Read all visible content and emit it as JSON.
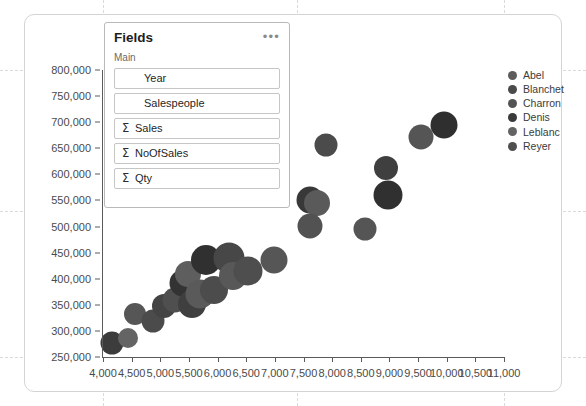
{
  "card": {
    "name": "scatter-chart-card"
  },
  "fields_panel": {
    "title": "Fields",
    "more_icon": "•••",
    "subtitle": "Main",
    "sigma_glyph": "Σ",
    "items": [
      {
        "label": "Year",
        "aggregated": false
      },
      {
        "label": "Salespeople",
        "aggregated": false
      },
      {
        "label": "Sales",
        "aggregated": true
      },
      {
        "label": "NoOfSales",
        "aggregated": true
      },
      {
        "label": "Qty",
        "aggregated": true
      }
    ]
  },
  "legend": {
    "position": "right",
    "entries": [
      {
        "label": "Abel",
        "color": "#5c5c5c"
      },
      {
        "label": "Blanchet",
        "color": "#4a4a4a"
      },
      {
        "label": "Charron",
        "color": "#545454"
      },
      {
        "label": "Denis",
        "color": "#3a3a3a"
      },
      {
        "label": "Leblanc",
        "color": "#636363"
      },
      {
        "label": "Reyer",
        "color": "#4f4f4f"
      }
    ]
  },
  "chart_data": {
    "type": "scatter",
    "title": "",
    "xlabel": "",
    "ylabel": "",
    "xlim": [
      4000,
      11000
    ],
    "ylim": [
      250000,
      800000
    ],
    "xticks": [
      4000,
      4500,
      5000,
      5500,
      6000,
      6500,
      7000,
      7500,
      8000,
      8500,
      9000,
      9500,
      10000,
      10500,
      11000
    ],
    "xticklabels": [
      "4,000",
      "4,500",
      "5,000",
      "5,500",
      "6,000",
      "6,500",
      "7,000",
      "7,500",
      "8,000",
      "8,500",
      "9,000",
      "9,500",
      "10,000",
      "10,500",
      "11,000"
    ],
    "yticks": [
      250000,
      300000,
      350000,
      400000,
      450000,
      500000,
      550000,
      600000,
      650000,
      700000,
      750000,
      800000
    ],
    "yticklabels": [
      "250,000",
      "300,000",
      "350,000",
      "400,000",
      "450,000",
      "500,000",
      "550,000",
      "600,000",
      "650,000",
      "700,000",
      "750,000",
      "800,000"
    ],
    "grid": "dashed",
    "legend_position": "right",
    "size_encodes": "Qty",
    "points": [
      {
        "series": "Denis",
        "x": 4150,
        "y": 277000,
        "r": 11.5,
        "color": "#3c3c3c"
      },
      {
        "series": "Leblanc",
        "x": 4430,
        "y": 286000,
        "r": 10.0,
        "color": "#646464"
      },
      {
        "series": "Charron",
        "x": 4560,
        "y": 333000,
        "r": 11.0,
        "color": "#565656"
      },
      {
        "series": "Abel",
        "x": 4870,
        "y": 319000,
        "r": 11.5,
        "color": "#4b4b4b"
      },
      {
        "series": "Blanchet",
        "x": 5060,
        "y": 347000,
        "r": 12.0,
        "color": "#444444"
      },
      {
        "series": "Reyer",
        "x": 5260,
        "y": 360000,
        "r": 12.5,
        "color": "#4f4f4f"
      },
      {
        "series": "Denis",
        "x": 5390,
        "y": 391000,
        "r": 13.5,
        "color": "#333333"
      },
      {
        "series": "Leblanc",
        "x": 5480,
        "y": 409000,
        "r": 13.0,
        "color": "#5e5e5e"
      },
      {
        "series": "Charron",
        "x": 5560,
        "y": 352000,
        "r": 14.0,
        "color": "#3f3f3f"
      },
      {
        "series": "Abel",
        "x": 5700,
        "y": 371000,
        "r": 14.5,
        "color": "#5a5a5a"
      },
      {
        "series": "Blanchet",
        "x": 5790,
        "y": 436000,
        "r": 15.0,
        "color": "#303030"
      },
      {
        "series": "Reyer",
        "x": 5930,
        "y": 378000,
        "r": 14.0,
        "color": "#4c4c4c"
      },
      {
        "series": "Denis",
        "x": 6200,
        "y": 440000,
        "r": 15.5,
        "color": "#474747"
      },
      {
        "series": "Leblanc",
        "x": 6270,
        "y": 405000,
        "r": 14.0,
        "color": "#585858"
      },
      {
        "series": "Charron",
        "x": 6530,
        "y": 415000,
        "r": 14.5,
        "color": "#4e4e4e"
      },
      {
        "series": "Abel",
        "x": 6980,
        "y": 436000,
        "r": 13.5,
        "color": "#565656"
      },
      {
        "series": "Blanchet",
        "x": 7620,
        "y": 551000,
        "r": 13.5,
        "color": "#383838"
      },
      {
        "series": "Reyer",
        "x": 7740,
        "y": 545000,
        "r": 13.0,
        "color": "#5a5a5a"
      },
      {
        "series": "Denis",
        "x": 7620,
        "y": 501000,
        "r": 12.5,
        "color": "#525252"
      },
      {
        "series": "Charron",
        "x": 7900,
        "y": 657000,
        "r": 11.5,
        "color": "#4b4b4b"
      },
      {
        "series": "Leblanc",
        "x": 8570,
        "y": 496000,
        "r": 11.5,
        "color": "#555555"
      },
      {
        "series": "Abel",
        "x": 8940,
        "y": 613000,
        "r": 12.0,
        "color": "#3f3f3f"
      },
      {
        "series": "Blanchet",
        "x": 8970,
        "y": 561000,
        "r": 14.5,
        "color": "#303030"
      },
      {
        "series": "Reyer",
        "x": 9550,
        "y": 672000,
        "r": 12.5,
        "color": "#555555"
      },
      {
        "series": "Denis",
        "x": 9950,
        "y": 694000,
        "r": 13.5,
        "color": "#2f2f2f"
      }
    ]
  },
  "design_grid": {
    "vertical_px": [
      103,
      297,
      504
    ],
    "horizontal_px": [
      70,
      211,
      357
    ]
  }
}
